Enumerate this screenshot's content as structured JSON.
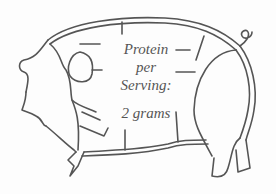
{
  "diagram": {
    "label": {
      "line1": "Protein",
      "line2": "per",
      "line3": "Serving:",
      "amount": "2 grams"
    },
    "colors": {
      "stroke": "#555555",
      "text": "#555555",
      "background": "#fdfdfd"
    }
  }
}
